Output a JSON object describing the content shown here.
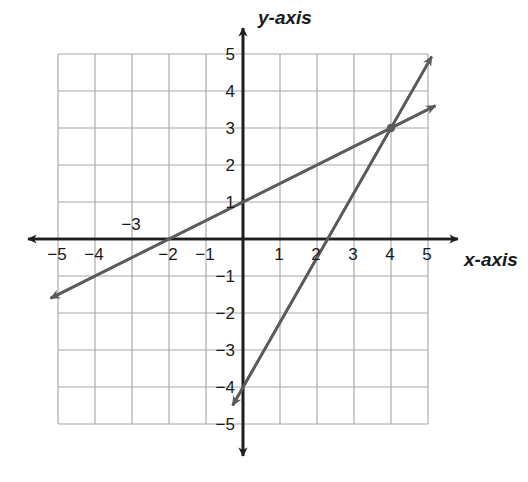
{
  "figure": {
    "kind": "coordinate-plane",
    "background_color": "#ffffff",
    "grid_color": "#a8a8a8",
    "axis_color": "#1f1f1f",
    "line_color": "#5b5b5b",
    "label_color": "#1a1a1a"
  },
  "axes": {
    "x_axis_label": "x-axis",
    "y_axis_label": "y-axis",
    "x_tick_labels": [
      "−5",
      "−4",
      "−3",
      "−2",
      "−1",
      "1",
      "2",
      "3",
      "4",
      "5"
    ],
    "y_tick_labels": [
      "5",
      "4",
      "3",
      "2",
      "1",
      "−1",
      "−2",
      "−3",
      "−4",
      "−5"
    ]
  },
  "chart_data": {
    "type": "line",
    "title": "",
    "xlabel": "x-axis",
    "ylabel": "y-axis",
    "xlim": [
      -5,
      5
    ],
    "ylim": [
      -5,
      5
    ],
    "xticks": [
      -5,
      -4,
      -3,
      -2,
      -1,
      1,
      2,
      3,
      4,
      5
    ],
    "yticks": [
      5,
      4,
      3,
      2,
      1,
      -1,
      -2,
      -3,
      -4,
      -5
    ],
    "grid": true,
    "grid_spacing": 1,
    "legend": "none",
    "series": [
      {
        "name": "shallow-line",
        "equation": "y = 0.5x + 1",
        "slope": 0.5,
        "y_intercept": 1,
        "x_intercept": -2,
        "x": [
          -5.2,
          5.2
        ],
        "values": [
          -1.6,
          3.6
        ],
        "arrows": "both"
      },
      {
        "name": "steep-line",
        "equation": "y = 1.75x - 4",
        "slope": 1.75,
        "y_intercept": -4,
        "x_intercept": 2.29,
        "x": [
          -0.28,
          5.1
        ],
        "values": [
          -4.5,
          4.93
        ],
        "arrows": "both"
      }
    ],
    "points": [
      {
        "name": "intersection",
        "x": 4,
        "y": 3,
        "marker": "dot"
      }
    ]
  }
}
